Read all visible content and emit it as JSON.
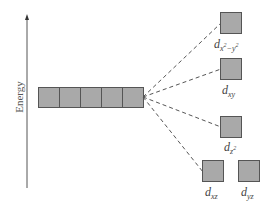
{
  "diagram": {
    "axis": {
      "label": "Energy"
    },
    "degenerate_set": {
      "count": 5
    },
    "colors": {
      "box_fill": "#a9a9a9",
      "box_stroke": "#555555",
      "line": "#555555",
      "text": "#444444"
    },
    "orbitals": [
      {
        "id": "dx2-y2",
        "prefix": "d",
        "sub": "x",
        "sup1": "2",
        "mid": "−y",
        "sup2": "2"
      },
      {
        "id": "dxy",
        "prefix": "d",
        "sub": "xy"
      },
      {
        "id": "dz2",
        "prefix": "d",
        "sub": "z",
        "sup1": "2"
      },
      {
        "id": "dxz",
        "prefix": "d",
        "sub": "xz"
      },
      {
        "id": "dyz",
        "prefix": "d",
        "sub": "yz"
      }
    ]
  }
}
